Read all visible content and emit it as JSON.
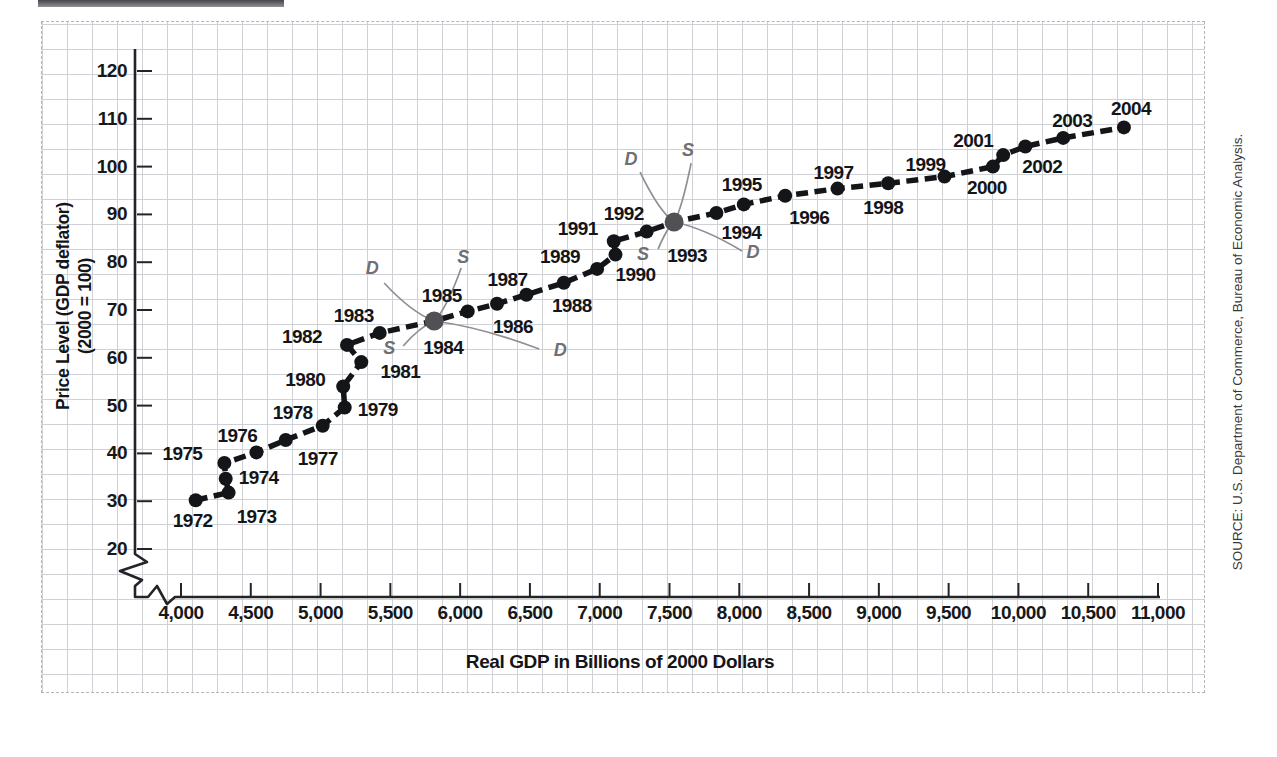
{
  "figure": {
    "source_note": "SOURCE: U.S. Department of Commerce, Bureau of Economic Analysis."
  },
  "chart_data": {
    "type": "scatter",
    "title": "",
    "xlabel": "Real GDP in Billions of 2000 Dollars",
    "ylabel_line1": "Price Level (GDP deflator)",
    "ylabel_line2": "(2000 = 100)",
    "xlim": [
      4000,
      11000
    ],
    "ylim": [
      20,
      120
    ],
    "grid": true,
    "axis_break": true,
    "legend": "none",
    "colors": {
      "series": "#141518",
      "point": "#141518",
      "special_point": "#505055",
      "ds_curve": "#8e8f93",
      "axis": "#232427"
    },
    "x_axis": {
      "tick_values": [
        4000,
        4500,
        5000,
        5500,
        6000,
        6500,
        7000,
        7500,
        8000,
        8500,
        9000,
        9500,
        10000,
        10500,
        11000
      ],
      "tick_labels": [
        "4,000",
        "4,500",
        "5,000",
        "5,500",
        "6,000",
        "6,500",
        "7,000",
        "7,500",
        "8,000",
        "8,500",
        "9,000",
        "9,500",
        "10,000",
        "10,500",
        "11,000"
      ]
    },
    "y_axis": {
      "tick_values": [
        20,
        30,
        40,
        50,
        60,
        70,
        80,
        90,
        100,
        110,
        120
      ],
      "tick_labels": [
        "20",
        "30",
        "40",
        "50",
        "60",
        "70",
        "80",
        "90",
        "100",
        "110",
        "120"
      ]
    },
    "points": [
      {
        "year": "1972",
        "gdp": 4105,
        "price_level": 30.2,
        "label_dx": -3,
        "label_dy": 21,
        "special": false
      },
      {
        "year": "1973",
        "gdp": 4341,
        "price_level": 31.8,
        "label_dx": 28,
        "label_dy": 24,
        "special": false
      },
      {
        "year": "1974",
        "gdp": 4320,
        "price_level": 34.7,
        "label_dx": 33,
        "label_dy": -1,
        "special": false
      },
      {
        "year": "1975",
        "gdp": 4311,
        "price_level": 38.0,
        "label_dx": -42,
        "label_dy": -9,
        "special": false
      },
      {
        "year": "1976",
        "gdp": 4540,
        "price_level": 40.2,
        "label_dx": -19,
        "label_dy": -16,
        "special": false
      },
      {
        "year": "1977",
        "gdp": 4750,
        "price_level": 42.8,
        "label_dx": 32,
        "label_dy": 19,
        "special": false
      },
      {
        "year": "1978",
        "gdp": 5015,
        "price_level": 45.8,
        "label_dx": -30,
        "label_dy": -13,
        "special": false
      },
      {
        "year": "1979",
        "gdp": 5173,
        "price_level": 49.6,
        "label_dx": 33,
        "label_dy": 2,
        "special": false
      },
      {
        "year": "1980",
        "gdp": 5162,
        "price_level": 54.0,
        "label_dx": -38,
        "label_dy": -6,
        "special": false
      },
      {
        "year": "1981",
        "gdp": 5292,
        "price_level": 59.1,
        "label_dx": 39,
        "label_dy": 10,
        "special": false
      },
      {
        "year": "1982",
        "gdp": 5189,
        "price_level": 62.7,
        "label_dx": -45,
        "label_dy": -8,
        "special": false
      },
      {
        "year": "1983",
        "gdp": 5424,
        "price_level": 65.2,
        "label_dx": -26,
        "label_dy": -17,
        "special": false
      },
      {
        "year": "1984",
        "gdp": 5814,
        "price_level": 67.7,
        "label_dx": 9,
        "label_dy": 27,
        "special": true
      },
      {
        "year": "1985",
        "gdp": 6054,
        "price_level": 69.7,
        "label_dx": -26,
        "label_dy": -15,
        "special": false
      },
      {
        "year": "1986",
        "gdp": 6264,
        "price_level": 71.3,
        "label_dx": 16,
        "label_dy": 23,
        "special": false
      },
      {
        "year": "1987",
        "gdp": 6475,
        "price_level": 73.2,
        "label_dx": -19,
        "label_dy": -15,
        "special": false
      },
      {
        "year": "1988",
        "gdp": 6743,
        "price_level": 75.7,
        "label_dx": 8,
        "label_dy": 23,
        "special": false
      },
      {
        "year": "1989",
        "gdp": 6981,
        "price_level": 78.6,
        "label_dx": -37,
        "label_dy": -12,
        "special": false
      },
      {
        "year": "1990",
        "gdp": 7113,
        "price_level": 81.6,
        "label_dx": 20,
        "label_dy": 20,
        "special": false
      },
      {
        "year": "1991",
        "gdp": 7101,
        "price_level": 84.4,
        "label_dx": -36,
        "label_dy": -12,
        "special": false
      },
      {
        "year": "1992",
        "gdp": 7337,
        "price_level": 86.4,
        "label_dx": -23,
        "label_dy": -18,
        "special": false
      },
      {
        "year": "1993",
        "gdp": 7533,
        "price_level": 88.4,
        "label_dx": 13,
        "label_dy": 34,
        "special": true
      },
      {
        "year": "1994",
        "gdp": 7836,
        "price_level": 90.3,
        "label_dx": 25,
        "label_dy": 20,
        "special": false
      },
      {
        "year": "1995",
        "gdp": 8032,
        "price_level": 92.1,
        "label_dx": -2,
        "label_dy": -19,
        "special": false
      },
      {
        "year": "1996",
        "gdp": 8329,
        "price_level": 93.9,
        "label_dx": 24,
        "label_dy": 22,
        "special": false
      },
      {
        "year": "1997",
        "gdp": 8704,
        "price_level": 95.4,
        "label_dx": -4,
        "label_dy": -16,
        "special": false
      },
      {
        "year": "1998",
        "gdp": 9067,
        "price_level": 96.5,
        "label_dx": -5,
        "label_dy": 25,
        "special": false
      },
      {
        "year": "1999",
        "gdp": 9470,
        "price_level": 97.9,
        "label_dx": -19,
        "label_dy": -12,
        "special": false
      },
      {
        "year": "2000",
        "gdp": 9817,
        "price_level": 100.0,
        "label_dx": -6,
        "label_dy": 21,
        "special": false
      },
      {
        "year": "2001",
        "gdp": 9891,
        "price_level": 102.4,
        "label_dx": -30,
        "label_dy": -14,
        "special": false
      },
      {
        "year": "2002",
        "gdp": 10049,
        "price_level": 104.2,
        "label_dx": 17,
        "label_dy": 20,
        "special": false
      },
      {
        "year": "2003",
        "gdp": 10321,
        "price_level": 106.0,
        "label_dx": 9,
        "label_dy": -17,
        "special": false
      },
      {
        "year": "2004",
        "gdp": 10756,
        "price_level": 108.2,
        "label_dx": 7,
        "label_dy": -18,
        "special": false
      }
    ],
    "ds_annotations": [
      {
        "at_year": "1984",
        "demand_rel": {
          "x1": -50,
          "y1": -38,
          "x2": 105,
          "y2": 28
        },
        "supply_rel": {
          "x1": -31,
          "y1": 25,
          "x2": 27,
          "y2": -53
        },
        "labels": [
          {
            "text": "D",
            "dx": -62,
            "dy": -53
          },
          {
            "text": "S",
            "dx": 29,
            "dy": -64
          },
          {
            "text": "S",
            "dx": -45,
            "dy": 27
          },
          {
            "text": "D",
            "dx": 126,
            "dy": 29
          }
        ]
      },
      {
        "at_year": "1993",
        "demand_rel": {
          "x1": -34,
          "y1": -50,
          "x2": 68,
          "y2": 29
        },
        "supply_rel": {
          "x1": -16,
          "y1": 27,
          "x2": 17,
          "y2": -59
        },
        "labels": [
          {
            "text": "D",
            "dx": -43,
            "dy": -63
          },
          {
            "text": "S",
            "dx": 14,
            "dy": -72
          },
          {
            "text": "S",
            "dx": -31,
            "dy": 32
          },
          {
            "text": "D",
            "dx": 79,
            "dy": 30
          }
        ]
      }
    ]
  }
}
